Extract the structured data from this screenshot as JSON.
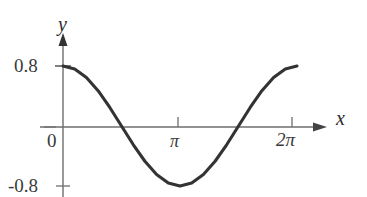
{
  "figure": {
    "name": "cosine-curve-plot",
    "background_color": "#ffffff",
    "curve_color": "#333333",
    "axis_color": "#6e6e6e",
    "text_color": "#2b2b2b"
  },
  "axes": {
    "x_axis_label": "x",
    "y_axis_label": "y",
    "origin_label": "0",
    "x_ticks": [
      {
        "label": "π",
        "value": 3.14159
      },
      {
        "label": "2π",
        "value": 6.28319
      }
    ],
    "y_ticks": [
      {
        "label": "0.8",
        "value": 0.8
      },
      {
        "label": "-0.8",
        "value": -0.8
      }
    ]
  },
  "chart_data": {
    "type": "line",
    "title": "",
    "subtitle": "",
    "xlabel": "x",
    "ylabel": "y",
    "xlim": [
      0,
      6.28319
    ],
    "ylim": [
      -0.8,
      0.8
    ],
    "xticks": [
      0,
      3.14159,
      6.28319
    ],
    "xticklabels": [
      "0",
      "π",
      "2π"
    ],
    "yticks": [
      -0.8,
      0.8
    ],
    "yticklabels": [
      "-0.8",
      "0.8"
    ],
    "grid": false,
    "legend": false,
    "legend_position": "none",
    "annotations": [],
    "series": [
      {
        "name": "y = 0.8 cos(x)",
        "equation": "y = 0.8*cos(x)",
        "x": [
          0,
          0.3142,
          0.6283,
          0.9425,
          1.2566,
          1.5708,
          1.885,
          2.1991,
          2.5133,
          2.8274,
          3.1416,
          3.4558,
          3.7699,
          4.0841,
          4.3982,
          4.7124,
          5.0265,
          5.3407,
          5.6549,
          5.969,
          6.2832
        ],
        "values": [
          0.8,
          0.7608,
          0.6472,
          0.4702,
          0.2472,
          0.0,
          -0.2472,
          -0.4702,
          -0.6472,
          -0.7608,
          -0.8,
          -0.7608,
          -0.6472,
          -0.4702,
          -0.2472,
          0.0,
          0.2472,
          0.4702,
          0.6472,
          0.7608,
          0.8
        ]
      }
    ],
    "zero_crossings": [
      1.5708,
      4.7124
    ],
    "maxima": [
      {
        "x": 0,
        "y": 0.8
      },
      {
        "x": 6.28319,
        "y": 0.8
      }
    ],
    "minima": [
      {
        "x": 3.14159,
        "y": -0.8
      }
    ]
  }
}
